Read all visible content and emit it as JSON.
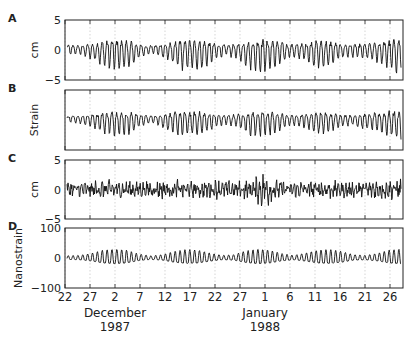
{
  "chart_data": [
    {
      "type": "line",
      "panel": "A",
      "ylabel": "cm",
      "ylim": [
        -5,
        5
      ],
      "yticks": [
        "5",
        "0",
        "−5"
      ],
      "description": "Tidal displacement oscillation, amplitude ~1–3 cm with fortnightly modulation",
      "envelope": [
        1,
        1,
        1.5,
        2.5,
        3,
        2.8,
        1.2,
        0.8,
        1.5,
        2.8,
        3,
        2.8,
        1.5,
        1,
        1.8,
        3,
        3.2,
        2.5,
        1.2,
        1.5,
        2.5,
        2.8,
        1.5,
        1.2,
        1.5,
        1.8,
        2.8,
        3.5
      ]
    },
    {
      "type": "line",
      "panel": "B",
      "ylabel": "Strain",
      "description": "Strain record with tidal oscillation, no numeric y ticks",
      "envelope": [
        0.6,
        0.8,
        1.2,
        2,
        2.4,
        2.2,
        1,
        0.8,
        1.5,
        2.4,
        2.5,
        2.2,
        1.2,
        1,
        1.5,
        2.5,
        2.6,
        2,
        1,
        1.2,
        2,
        2.2,
        1.2,
        1,
        1.5,
        1.8,
        2.5,
        3
      ]
    },
    {
      "type": "line",
      "panel": "C",
      "ylabel": "cm",
      "ylim": [
        -5,
        5
      ],
      "yticks": [
        "5",
        "0",
        "−5"
      ],
      "description": "Residual displacement, irregular fluctuations ~±2 cm, spike near Jan 5",
      "envelope": [
        1.5,
        1.5,
        1.6,
        1.8,
        1.8,
        1.5,
        1.5,
        1.6,
        1.8,
        1.8,
        1.5,
        1.6,
        1.8,
        1.6,
        1.6,
        2,
        3.5,
        1.8,
        1.5,
        1.6,
        1.8,
        1.8,
        1.6,
        1.5,
        1.8,
        1.8,
        1.8,
        2.2
      ]
    },
    {
      "type": "line",
      "panel": "D",
      "ylabel": "Nanostrain",
      "ylim": [
        -100,
        100
      ],
      "yticks": [
        "100",
        "0",
        "−100"
      ],
      "description": "Theoretical tidal strain, spring-neap modulation with peaks ~40 nanostrain",
      "envelope": [
        10,
        12,
        20,
        35,
        40,
        35,
        18,
        10,
        15,
        30,
        38,
        35,
        22,
        12,
        15,
        32,
        40,
        35,
        20,
        12,
        22,
        35,
        38,
        30,
        15,
        12,
        20,
        35,
        40
      ]
    }
  ],
  "figure": {
    "panel_labels": [
      "A",
      "B",
      "C",
      "D"
    ],
    "xaxis": {
      "tick_labels": [
        "22",
        "27",
        "2",
        "7",
        "12",
        "17",
        "22",
        "27",
        "1",
        "6",
        "11",
        "16",
        "21",
        "26"
      ],
      "month_labels": [
        {
          "month": "December",
          "year": "1987"
        },
        {
          "month": "January",
          "year": "1988"
        }
      ]
    }
  }
}
